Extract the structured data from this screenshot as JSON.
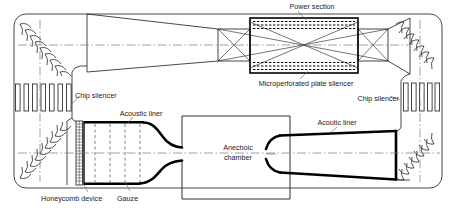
{
  "figure": {
    "title_visible": false,
    "background_color": "#ffffff",
    "line_color": "#1a1a1a",
    "text_color": "#1a1a1a",
    "thick_line_color": "#000000"
  },
  "labels": {
    "power_section": "Power section",
    "microperforated_plate_silencer": "Microperforated plate silencer",
    "chip_silencer_left": "Chip silencer",
    "chip_silencer_right": "Chip silencer",
    "acoustic_liner_left": "Acoustic liner",
    "acoustic_liner_right": "Acoutic liner",
    "anechoic_chamber_line1": "Anechoic",
    "anechoic_chamber_line2": "chamber",
    "honeycomb_device": "Honeycomb device",
    "gauze": "Gauze"
  },
  "components": [
    {
      "name": "power-section",
      "label": "Power section",
      "kind": "fan-drive-box"
    },
    {
      "name": "microperforated-plate-silencer",
      "label": "Microperforated plate silencer",
      "kind": "dashed-lining"
    },
    {
      "name": "chip-silencer-left",
      "label": "Chip silencer",
      "kind": "vertical-bars",
      "bar_count": 7
    },
    {
      "name": "chip-silencer-right",
      "label": "Chip silencer",
      "kind": "vertical-bars",
      "bar_count": 6
    },
    {
      "name": "turning-vanes-top-left",
      "kind": "corner-vanes",
      "vane_count": 9
    },
    {
      "name": "turning-vanes-bottom-left",
      "kind": "corner-vanes",
      "vane_count": 9
    },
    {
      "name": "turning-vanes-top-right",
      "kind": "corner-vanes",
      "vane_count": 7
    },
    {
      "name": "turning-vanes-bottom-right",
      "kind": "corner-vanes",
      "vane_count": 7
    },
    {
      "name": "honeycomb-device",
      "label": "Honeycomb device",
      "kind": "grid-block"
    },
    {
      "name": "gauze",
      "label": "Gauze",
      "kind": "dashed-screens",
      "screen_count": 4
    },
    {
      "name": "acoustic-liner-settling-chamber",
      "label": "Acoustic liner",
      "kind": "thick-lining"
    },
    {
      "name": "contraction-nozzle",
      "kind": "nozzle"
    },
    {
      "name": "anechoic-chamber",
      "label": "Anechoic chamber",
      "kind": "open-jet-room"
    },
    {
      "name": "collector-diffuser",
      "label": "Acoutic liner",
      "kind": "thick-lining"
    },
    {
      "name": "centerline",
      "kind": "dash-dot-axis"
    }
  ]
}
